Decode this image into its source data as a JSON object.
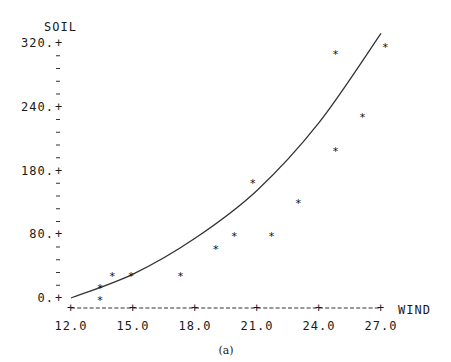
{
  "chart_data": {
    "type": "scatter",
    "title": "",
    "caption": "(a)",
    "xlabel": "WIND",
    "ylabel": "SOIL",
    "x_ticks": [
      "12.0",
      "15.0",
      "18.0",
      "21.0",
      "24.0",
      "27.0"
    ],
    "x_tick_values": [
      12,
      15,
      18,
      21,
      24,
      27
    ],
    "y_ticks": [
      "320.",
      "240.",
      "180.",
      "80.",
      "0."
    ],
    "xlim": [
      12,
      27
    ],
    "ylim": [
      0,
      320
    ],
    "grid": false,
    "legend": null,
    "marker": "*",
    "series": [
      {
        "name": "observations",
        "type": "scatter",
        "points": [
          {
            "x": 13.4,
            "y": 15
          },
          {
            "x": 13.4,
            "y": 0
          },
          {
            "x": 14.0,
            "y": 30
          },
          {
            "x": 14.9,
            "y": 30
          },
          {
            "x": 17.3,
            "y": 30
          },
          {
            "x": 19.0,
            "y": 64
          },
          {
            "x": 19.9,
            "y": 80
          },
          {
            "x": 20.8,
            "y": 147
          },
          {
            "x": 21.7,
            "y": 80
          },
          {
            "x": 23.0,
            "y": 122
          },
          {
            "x": 24.8,
            "y": 309
          },
          {
            "x": 24.8,
            "y": 187
          },
          {
            "x": 26.1,
            "y": 230
          },
          {
            "x": 27.2,
            "y": 318
          }
        ]
      },
      {
        "name": "fitted curve",
        "type": "line",
        "points": [
          {
            "x": 12.0,
            "y": 0
          },
          {
            "x": 15.0,
            "y": 30
          },
          {
            "x": 18.0,
            "y": 75
          },
          {
            "x": 21.0,
            "y": 135
          },
          {
            "x": 24.0,
            "y": 220
          },
          {
            "x": 27.0,
            "y": 332
          }
        ]
      }
    ]
  }
}
